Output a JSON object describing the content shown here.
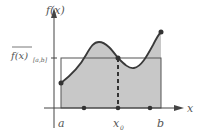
{
  "diagram": {
    "y_axis_label": "f(x)",
    "x_axis_label": "x",
    "mean_label_main": "f(x)",
    "mean_label_sub": "[a,b]",
    "tick_a": "a",
    "tick_x0": "x",
    "tick_x0_sub": "0",
    "tick_b": "b",
    "colors": {
      "fill": "#c8c8c8",
      "curve": "#3a3a3a",
      "axes": "#444444",
      "text": "#555555"
    }
  }
}
